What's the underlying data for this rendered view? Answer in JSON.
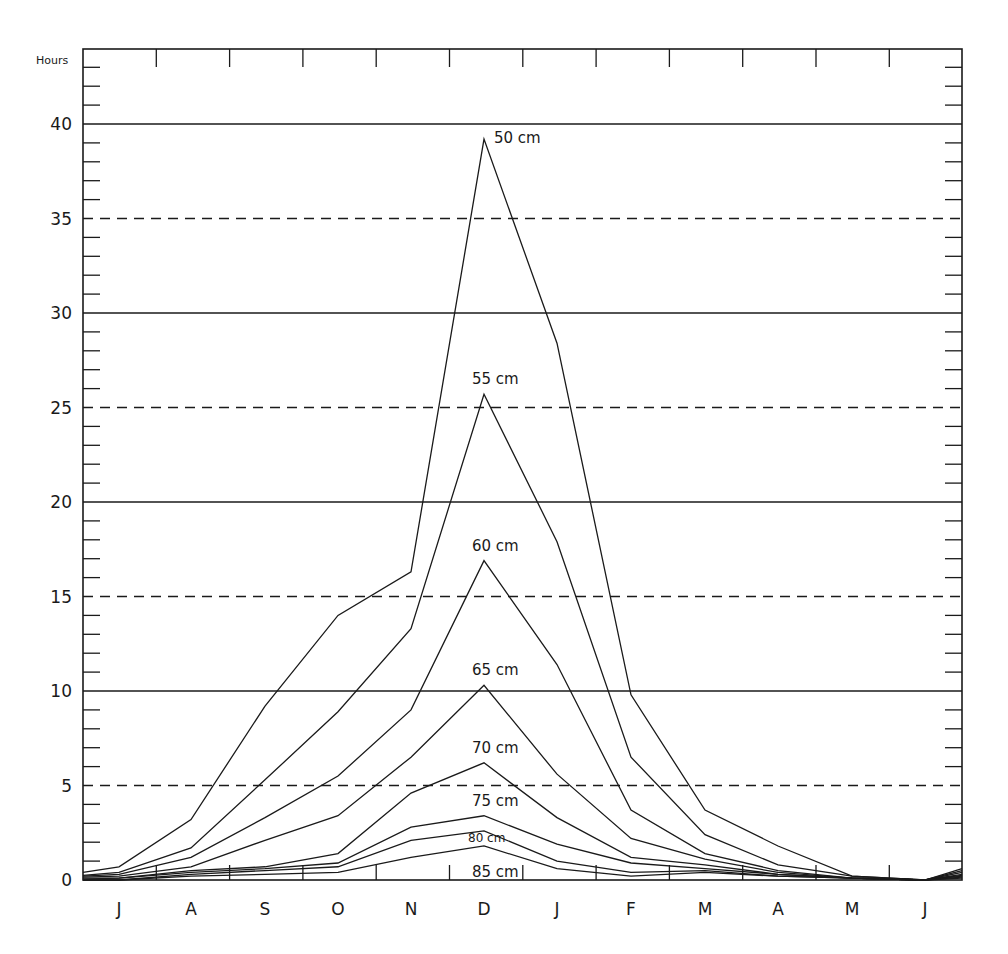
{
  "chart_data": {
    "type": "line",
    "title": "",
    "xlabel": "",
    "ylabel": "Hours",
    "ylim": [
      0,
      44
    ],
    "grid": {
      "solid_at": [
        10,
        20,
        30,
        40
      ],
      "dashed_at": [
        5,
        15,
        25,
        35
      ]
    },
    "y_ticks": [
      0,
      5,
      10,
      15,
      20,
      25,
      30,
      35,
      40
    ],
    "categories": [
      "J",
      "A",
      "S",
      "O",
      "N",
      "D",
      "J",
      "F",
      "M",
      "A",
      "M",
      "J"
    ],
    "series": [
      {
        "name": "50 cm",
        "values": [
          0.7,
          3.2,
          9.2,
          14.0,
          16.3,
          39.2,
          28.4,
          9.8,
          3.7,
          1.8,
          0.2,
          0.0
        ]
      },
      {
        "name": "55 cm",
        "values": [
          0.4,
          1.7,
          5.3,
          8.9,
          13.3,
          25.7,
          17.9,
          6.5,
          2.4,
          0.8,
          0.2,
          0.0
        ]
      },
      {
        "name": "60 cm",
        "values": [
          0.3,
          1.2,
          3.3,
          5.5,
          9.0,
          16.9,
          11.4,
          3.7,
          1.4,
          0.5,
          0.1,
          0.0
        ]
      },
      {
        "name": "65 cm",
        "values": [
          0.2,
          0.7,
          2.1,
          3.4,
          6.5,
          10.3,
          5.6,
          2.2,
          1.1,
          0.4,
          0.1,
          0.0
        ]
      },
      {
        "name": "70 cm",
        "values": [
          0.1,
          0.5,
          0.7,
          1.4,
          4.6,
          6.2,
          3.3,
          1.2,
          0.8,
          0.3,
          0.1,
          0.0
        ]
      },
      {
        "name": "75 cm",
        "values": [
          0.1,
          0.4,
          0.6,
          0.9,
          2.8,
          3.4,
          1.9,
          0.9,
          0.6,
          0.3,
          0.1,
          0.0
        ]
      },
      {
        "name": "80 cm",
        "values": [
          0.0,
          0.3,
          0.5,
          0.7,
          2.1,
          2.6,
          1.0,
          0.4,
          0.5,
          0.2,
          0.1,
          0.0
        ]
      },
      {
        "name": "85 cm",
        "values": [
          0.0,
          0.2,
          0.3,
          0.4,
          1.2,
          1.8,
          0.6,
          0.2,
          0.4,
          0.2,
          0.1,
          0.0
        ]
      }
    ],
    "edge_values": {
      "left": [
        0.4,
        0.25,
        0.2,
        0.15,
        0.1,
        0.05,
        0.0,
        0.0
      ],
      "right": [
        0.6,
        0.5,
        0.4,
        0.3,
        0.25,
        0.2,
        0.15,
        0.1
      ]
    },
    "legend_position": "inline labels above peaks"
  }
}
